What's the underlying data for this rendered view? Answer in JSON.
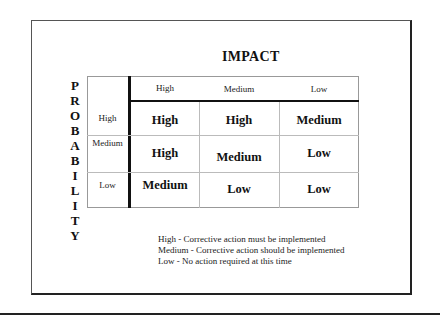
{
  "title": "IMPACT",
  "y_axis_label_letters": [
    "P",
    "R",
    "O",
    "B",
    "A",
    "B",
    "I",
    "L",
    "I",
    "T",
    "Y"
  ],
  "columns": [
    "High",
    "Medium",
    "Low"
  ],
  "rows": [
    {
      "label": "High",
      "cells": [
        "High",
        "High",
        "Medium"
      ]
    },
    {
      "label": "Medium",
      "cells": [
        "High",
        "Medium",
        "Low"
      ]
    },
    {
      "label": "Low",
      "cells": [
        "Medium",
        "Low",
        "Low"
      ]
    }
  ],
  "legend": [
    "High - Corrective action must be implemented",
    "Medium - Corrective action should be implemented",
    "Low - No action required at this time"
  ]
}
